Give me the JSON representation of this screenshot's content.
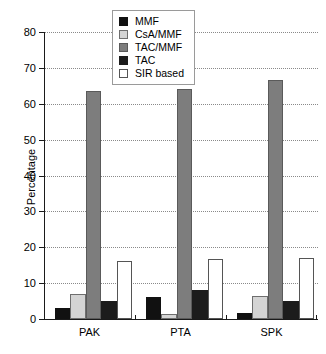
{
  "chart_data": {
    "type": "bar",
    "title": "",
    "subtitle": "",
    "xlabel": "",
    "ylabel": "Percentage",
    "categories": [
      "PAK",
      "PTA",
      "SPK"
    ],
    "ylim": [
      0,
      80
    ],
    "yticks": [
      0,
      10,
      20,
      30,
      40,
      50,
      60,
      70,
      80
    ],
    "ytick_labels": [
      "0",
      "10",
      "20",
      "30",
      "40",
      "50",
      "60",
      "70",
      "80"
    ],
    "grid": true,
    "grid_axis": "y",
    "legend_position": "top-center",
    "series": [
      {
        "name": "MMF",
        "color": "#111111",
        "edge": "#111111",
        "values": [
          3.0,
          6.2,
          1.7
        ]
      },
      {
        "name": "CsA/MMF",
        "color": "#d4d4d4",
        "edge": "#6e6e6e",
        "values": [
          7.0,
          1.3,
          6.3
        ]
      },
      {
        "name": "TAC/MMF",
        "color": "#7d7d7d",
        "edge": "#5a5a5a",
        "values": [
          63.5,
          64.1,
          66.5
        ]
      },
      {
        "name": "TAC",
        "color": "#1c1c1c",
        "edge": "#1c1c1c",
        "values": [
          5.0,
          8.0,
          4.9
        ]
      },
      {
        "name": "SIR based",
        "color": "#ffffff",
        "edge": "#555555",
        "values": [
          16.2,
          16.7,
          16.9
        ]
      }
    ]
  },
  "legend": {
    "items": [
      {
        "label": "MMF"
      },
      {
        "label": "CsA/MMF"
      },
      {
        "label": "TAC/MMF"
      },
      {
        "label": "TAC"
      },
      {
        "label": "SIR based"
      }
    ]
  }
}
